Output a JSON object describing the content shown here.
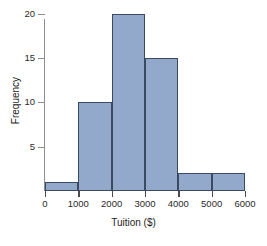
{
  "chart_data": {
    "type": "bar",
    "title": "",
    "subtitle": "",
    "xlabel": "Tuition ($)",
    "ylabel": "Frequency",
    "categories": [
      "0-1000",
      "1000-2000",
      "2000-3000",
      "3000-4000",
      "4000-5000",
      "5000-6000"
    ],
    "bin_edges": [
      0,
      1000,
      2000,
      3000,
      4000,
      5000,
      6000
    ],
    "values": [
      1,
      10,
      20,
      15,
      2,
      2
    ],
    "xlim": [
      0,
      6000
    ],
    "ylim": [
      0,
      20
    ],
    "xticks": [
      0,
      1000,
      2000,
      3000,
      4000,
      5000,
      6000
    ],
    "xtick_labels": [
      "0",
      "1000",
      "2000",
      "3000",
      "4000",
      "5000",
      "6000"
    ],
    "yticks": [
      5,
      10,
      15,
      20
    ],
    "ytick_labels": [
      "5",
      "10",
      "15",
      "20"
    ],
    "grid": false,
    "legend": false,
    "legend_position": "none",
    "bar_fill_color": "#92a9cc",
    "bar_border_color": "#3c4a61",
    "axis_color": "#8e8e90",
    "background_color": "#ffffff"
  }
}
